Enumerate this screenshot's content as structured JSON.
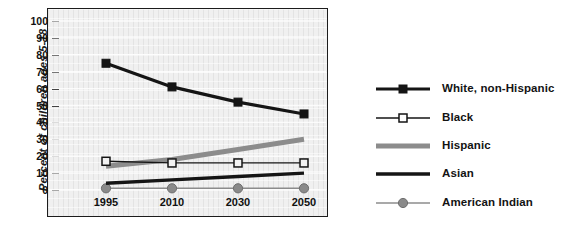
{
  "chart_data": {
    "type": "line",
    "title": "",
    "xlabel": "",
    "ylabel": "Percent of children ages 5-18",
    "categories": [
      "1995",
      "2010",
      "2030",
      "2050"
    ],
    "ylim": [
      0,
      100
    ],
    "yticks": [
      "0",
      "10",
      "20",
      "30",
      "40",
      "50",
      "60",
      "70",
      "80",
      "90",
      "100"
    ],
    "grid": true,
    "legend_position": "right",
    "series": [
      {
        "name": "White, non-Hispanic",
        "values": [
          75,
          61,
          52,
          45
        ],
        "color": "#151515",
        "marker": "filled-square",
        "width": 3.2
      },
      {
        "name": "Black",
        "values": [
          17,
          16,
          16,
          16
        ],
        "color": "#151515",
        "marker": "open-square",
        "width": 1.3
      },
      {
        "name": "Hispanic",
        "values": [
          14,
          18,
          24,
          30
        ],
        "color": "#8c8c8c",
        "marker": "none",
        "width": 5
      },
      {
        "name": "Asian",
        "values": [
          4,
          6,
          8,
          10
        ],
        "color": "#151515",
        "marker": "none",
        "width": 3.4
      },
      {
        "name": "American Indian",
        "values": [
          1,
          1,
          1,
          1
        ],
        "color": "#8c8c8c",
        "marker": "filled-circle",
        "width": 1.6
      }
    ]
  },
  "axis": {
    "y_title": "Percent of children ages 5-18",
    "y_tick_labels": [
      "100",
      "90",
      "80",
      "70",
      "60",
      "50",
      "40",
      "30",
      "20",
      "10",
      "0"
    ],
    "x_tick_labels": [
      "1995",
      "2010",
      "2030",
      "2050"
    ]
  },
  "legend": {
    "entries": [
      {
        "label": "White, non-Hispanic"
      },
      {
        "label": "Black"
      },
      {
        "label": "Hispanic"
      },
      {
        "label": "Asian"
      },
      {
        "label": "American Indian"
      }
    ]
  },
  "colors": {
    "ink": "#151515",
    "gray_series": "#8c8c8c",
    "plot_background": "#ebebeb",
    "page_background": "#ffffff"
  }
}
